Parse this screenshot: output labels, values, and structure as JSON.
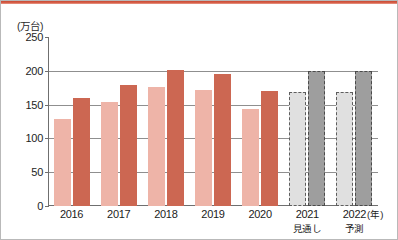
{
  "chart_data": {
    "type": "bar",
    "title": "",
    "unit_label": "(万台)",
    "xlabel": "(年)",
    "ylabel": "",
    "ylim": [
      0,
      250
    ],
    "yticks": [
      0,
      50,
      100,
      150,
      200,
      250
    ],
    "grid": true,
    "legend": "none",
    "categories": [
      "2016",
      "2017",
      "2018",
      "2019",
      "2020",
      "2021",
      "2022"
    ],
    "category_sublabels": [
      "",
      "",
      "",
      "",
      "",
      "見通し",
      "予測"
    ],
    "series": [
      {
        "name": "light",
        "values": [
          128,
          154,
          176,
          171,
          143,
          168,
          168
        ],
        "colors": [
          "#eeb4a8",
          "#eeb4a8",
          "#eeb4a8",
          "#eeb4a8",
          "#eeb4a8",
          "#e0e0e0",
          "#e0e0e0"
        ],
        "styles": [
          "solid",
          "solid",
          "solid",
          "solid",
          "solid",
          "dashed",
          "dashed"
        ]
      },
      {
        "name": "dark",
        "values": [
          160,
          179,
          201,
          196,
          170,
          200,
          200
        ],
        "colors": [
          "#cc6752",
          "#cc6752",
          "#cc6752",
          "#cc6752",
          "#cc6752",
          "#9e9e9e",
          "#9e9e9e"
        ],
        "styles": [
          "solid",
          "solid",
          "solid",
          "solid",
          "solid",
          "dashed",
          "dashed"
        ]
      }
    ],
    "accent_color": "#cc6752",
    "forecast_color": "#9e9e9e"
  }
}
